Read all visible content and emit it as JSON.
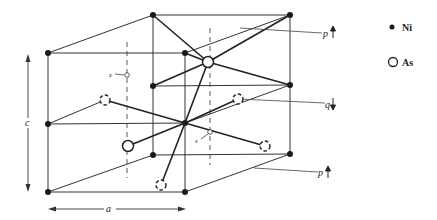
{
  "legend": {
    "items": [
      {
        "symbol": "filled-circle",
        "label": "Ni"
      },
      {
        "symbol": "open-circle",
        "label": "As"
      }
    ]
  },
  "axes": {
    "a_label": "a",
    "c_label": "c"
  },
  "layer_labels": {
    "p_top": "p",
    "q_mid": "q",
    "p_bottom": "p"
  },
  "site_labels": {
    "s_upper": "s",
    "s_lower": "s"
  },
  "colors": {
    "line": "#333333",
    "atom_fill": "#1a1a1a",
    "background": "#ffffff"
  },
  "atoms": {
    "ni": [
      {
        "x": 153,
        "y": 15
      },
      {
        "x": 290,
        "y": 15
      },
      {
        "x": 48,
        "y": 53
      },
      {
        "x": 185,
        "y": 53
      },
      {
        "x": 153,
        "y": 86
      },
      {
        "x": 290,
        "y": 85
      },
      {
        "x": 48,
        "y": 124
      },
      {
        "x": 185,
        "y": 123
      },
      {
        "x": 153,
        "y": 155
      },
      {
        "x": 290,
        "y": 154
      },
      {
        "x": 48,
        "y": 192
      },
      {
        "x": 185,
        "y": 192
      }
    ],
    "as_solid": [
      {
        "x": 208,
        "y": 62
      },
      {
        "x": 128,
        "y": 146
      }
    ],
    "as_dashed": [
      {
        "x": 105,
        "y": 100
      },
      {
        "x": 238,
        "y": 99
      },
      {
        "x": 265,
        "y": 146
      },
      {
        "x": 161,
        "y": 185
      }
    ]
  }
}
